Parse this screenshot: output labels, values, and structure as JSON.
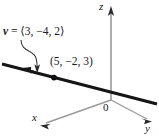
{
  "figure": {
    "type": "diagram",
    "width": 159,
    "height": 138,
    "background_color": "#ffffff",
    "ink_color": "#1a1a1a",
    "axis_color": "#8c8c8c",
    "line_color": "#1a1a1a"
  },
  "axes": {
    "z": {
      "label": "z",
      "direction": "up",
      "arrow": true
    },
    "y": {
      "label": "y",
      "direction": "down-right",
      "arrow": true
    },
    "x": {
      "label": "x",
      "direction": "down-left",
      "arrow": true
    },
    "origin": {
      "label": "0"
    }
  },
  "annotations": {
    "vector": {
      "name": "v",
      "equals": "=",
      "components_text": "⟨3, −4, 2⟩",
      "full_text": "v = ⟨3, −4, 2⟩",
      "components": [
        3,
        -4,
        2
      ]
    },
    "point": {
      "label": "(5, −2, 3)",
      "coordinates": [
        5,
        -2,
        3
      ]
    }
  },
  "marks": {
    "point_dot": {
      "name": "point-dot",
      "x": 54,
      "y": 78
    },
    "direction_arrow": {
      "name": "line-direction-arrow",
      "points": "left"
    },
    "pointer_curve": {
      "name": "vector-pointer-arrow",
      "from": "vector-label",
      "to": "thick-line"
    }
  }
}
